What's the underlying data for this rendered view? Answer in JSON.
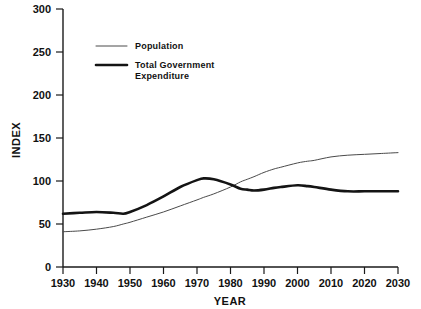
{
  "chart_data": {
    "type": "line",
    "title": "",
    "xlabel": "YEAR",
    "ylabel": "INDEX",
    "xlim": [
      1930,
      2030
    ],
    "ylim": [
      0,
      300
    ],
    "xticks": [
      1930,
      1940,
      1950,
      1960,
      1970,
      1980,
      1990,
      2000,
      2010,
      2020,
      2030
    ],
    "yticks": [
      0,
      50,
      100,
      150,
      200,
      250,
      300
    ],
    "grid": false,
    "legend_position": "upper-left",
    "x": [
      1930,
      1935,
      1940,
      1945,
      1948,
      1950,
      1955,
      1960,
      1965,
      1970,
      1972,
      1975,
      1980,
      1983,
      1985,
      1987,
      1990,
      1993,
      1995,
      2000,
      2003,
      2005,
      2010,
      2015,
      2020,
      2025,
      2030
    ],
    "series": [
      {
        "name": "Population",
        "values": [
          41,
          42,
          44,
          47,
          50,
          52,
          58,
          64,
          71,
          78,
          81,
          85,
          93,
          99,
          102,
          105,
          110,
          114,
          116,
          121,
          123,
          124,
          128,
          130,
          131,
          132,
          133
        ],
        "style": "thin",
        "color": "#4a4a4a"
      },
      {
        "name": "Total Government Expenditure",
        "values": [
          62,
          63,
          64,
          63,
          62,
          64,
          72,
          82,
          93,
          101,
          103,
          102,
          96,
          91,
          90,
          89,
          90,
          92,
          93,
          95,
          94,
          93,
          90,
          88,
          88,
          88,
          88
        ],
        "style": "thick",
        "color": "#141414"
      }
    ],
    "legend": [
      {
        "label": "Population",
        "style": "thin"
      },
      {
        "label": "Total Government Expenditure",
        "style": "thick"
      }
    ]
  },
  "axes": {
    "y_tick_labels": [
      "300",
      "250",
      "200",
      "150",
      "100",
      "50",
      "0"
    ],
    "x_tick_labels": [
      "1930",
      "1940",
      "1950",
      "1960",
      "1970",
      "1980",
      "1990",
      "2000",
      "2010",
      "2020",
      "2030"
    ],
    "y_axis_title": "INDEX",
    "x_axis_title": "YEAR"
  },
  "legend": {
    "entry_population": "Population",
    "entry_expenditure_line1": "Total Government",
    "entry_expenditure_line2": "Expenditure"
  }
}
